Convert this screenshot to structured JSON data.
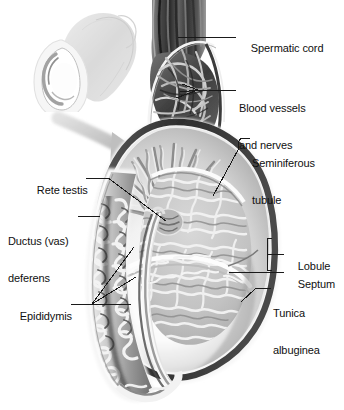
{
  "figure": {
    "kind": "anatomical-illustration",
    "style": "grayscale medical illustration",
    "background_color": "#ffffff",
    "label_text_color": "#101010",
    "leader_line_color": "#1a1a1a"
  },
  "inset": {
    "name": "orientation-inset",
    "description": "small pale grayscale view of the scrotum and penis showing orientation",
    "tone": "#c8c8c8"
  },
  "arrow": {
    "name": "magnification-arrow",
    "description": "curved gray arrow pointing from the inset down-right to the main sectioned view",
    "color": "#b4b4b4"
  },
  "labels": [
    {
      "id": "spermatic-cord",
      "text": "Spermatic cord",
      "side": "right",
      "text_x": 239,
      "text_y": 32,
      "leader": "horizontal line from text left edge to the dark vertical cord"
    },
    {
      "id": "blood-vessels-and-nerves",
      "text": "Blood vessels\nand nerves",
      "line1": "Blood vessels",
      "line2": "and nerves",
      "side": "right",
      "text_x": 239,
      "text_y": 78,
      "leader": "horizontal line branching into three short strokes over the vessel plexus"
    },
    {
      "id": "seminiferous-tubule",
      "text": "Seminiferous\ntubule",
      "line1": "Seminiferous",
      "line2": "tubule",
      "side": "right",
      "text_x": 252,
      "text_y": 133,
      "leader": "hooked line descending left into the convoluted tubule mass"
    },
    {
      "id": "lobule",
      "text": "Lobule",
      "side": "right",
      "text_x": 286,
      "text_y": 250,
      "leader": "square bracket spanning a wedge of testis tissue"
    },
    {
      "id": "septum",
      "text": "Septum",
      "side": "right",
      "text_x": 286,
      "text_y": 267,
      "leader": "horizontal line to a septal partition"
    },
    {
      "id": "tunica-albuginea",
      "text": "Tunica\nalbuginea",
      "line1": "Tunica",
      "line2": "albuginea",
      "side": "right",
      "text_x": 272,
      "text_y": 283,
      "leader": "short diagonal line to the dense outer capsule"
    },
    {
      "id": "rete-testis",
      "text": "Rete testis",
      "side": "left",
      "text_x": 25,
      "text_y": 173,
      "leader": "long diagonal line running down-right to the converging duct network"
    },
    {
      "id": "ductus-vas-deferens",
      "text": "Ductus (vas)\ndeferens",
      "line1": "Ductus (vas)",
      "line2": "deferens",
      "side": "left",
      "text_x": 8,
      "text_y": 211,
      "leader": "short horizontal line to the thick duct along the posterior border"
    },
    {
      "id": "epididymis",
      "text": "Epididymis",
      "side": "left",
      "text_x": 8,
      "text_y": 299,
      "leader": "three fanned lines pointing into the coiled epididymal mass"
    }
  ],
  "structures": [
    {
      "id": "spermatic-cord-body",
      "name": "spermatic cord"
    },
    {
      "id": "vessel-plexus",
      "name": "blood vessels and nerves"
    },
    {
      "id": "testis-body",
      "name": "testis"
    },
    {
      "id": "seminiferous-mass",
      "name": "seminiferous tubules"
    },
    {
      "id": "septa-fan",
      "name": "septa"
    },
    {
      "id": "rete-testis-node",
      "name": "rete testis"
    },
    {
      "id": "tunica-capsule",
      "name": "tunica albuginea"
    },
    {
      "id": "epididymis-coil",
      "name": "epididymis"
    },
    {
      "id": "vas-deferens-duct",
      "name": "ductus deferens"
    }
  ]
}
